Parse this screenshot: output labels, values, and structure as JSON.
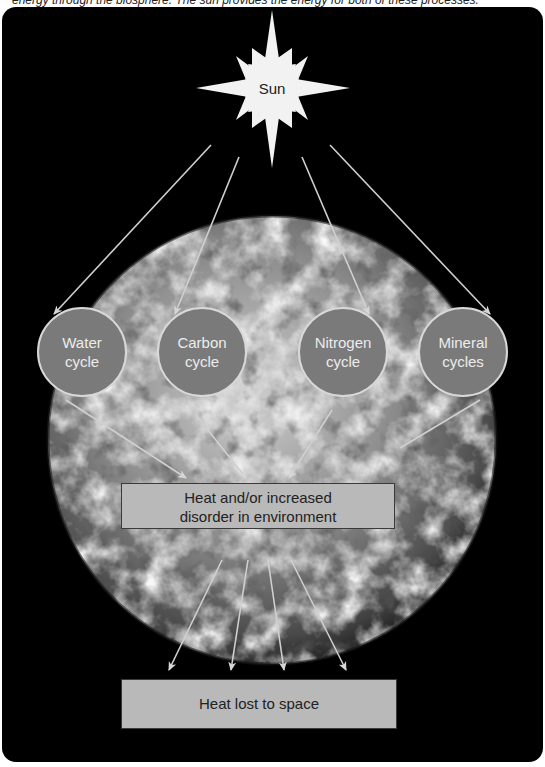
{
  "caption": "energy through the biosphere. The sun provides the energy for both of these processes.",
  "sun": {
    "label": "Sun"
  },
  "cycles": [
    {
      "label_line1": "Water",
      "label_line2": "cycle"
    },
    {
      "label_line1": "Carbon",
      "label_line2": "cycle"
    },
    {
      "label_line1": "Nitrogen",
      "label_line2": "cycle"
    },
    {
      "label_line1": "Mineral",
      "label_line2": "cycles"
    }
  ],
  "heat_box": {
    "line1": "Heat and/or increased",
    "line2": "disorder in environment"
  },
  "space_box": {
    "label": "Heat lost to space"
  },
  "colors": {
    "background": "#000000",
    "circle_fill": "#7a7a7a",
    "circle_stroke": "#d8d8d8",
    "box_fill": "#b9b9b9",
    "arrow": "#d0d0d0"
  },
  "flows": [
    {
      "from": "Sun",
      "to": "Water cycle"
    },
    {
      "from": "Sun",
      "to": "Carbon cycle"
    },
    {
      "from": "Sun",
      "to": "Nitrogen cycle"
    },
    {
      "from": "Sun",
      "to": "Mineral cycles"
    },
    {
      "from": "Water cycle",
      "to": "Heat and/or increased disorder in environment"
    },
    {
      "from": "Carbon cycle",
      "to": "Heat and/or increased disorder in environment"
    },
    {
      "from": "Nitrogen cycle",
      "to": "Heat and/or increased disorder in environment"
    },
    {
      "from": "Mineral cycles",
      "to": "Heat and/or increased disorder in environment"
    },
    {
      "from": "Heat and/or increased disorder in environment",
      "to": "Heat lost to space",
      "count": 4
    }
  ]
}
